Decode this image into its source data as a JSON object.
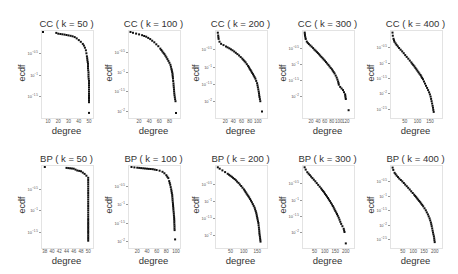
{
  "chart_data": [
    {
      "type": "scatter",
      "title": "CC ( k = 50 )",
      "xlabel": "degree",
      "ylabel": "ecdf",
      "xticks": [
        "10",
        "20",
        "30",
        "40",
        "50"
      ],
      "xlim": [
        5,
        51
      ],
      "yticks": [
        "10^-0.5",
        "10^-1",
        "10^-1.5"
      ],
      "ylim": [
        -1.95,
        0
      ],
      "yscale": "log10",
      "points": [
        [
          5,
          0
        ],
        [
          18,
          -0.02
        ],
        [
          20,
          -0.04
        ],
        [
          26,
          -0.06
        ],
        [
          30,
          -0.08
        ],
        [
          34,
          -0.1
        ],
        [
          36,
          -0.12
        ],
        [
          38,
          -0.15
        ],
        [
          40,
          -0.19
        ],
        [
          42,
          -0.23
        ],
        [
          44,
          -0.28
        ],
        [
          45,
          -0.32
        ],
        [
          46,
          -0.37
        ],
        [
          47,
          -0.43
        ],
        [
          47.5,
          -0.5
        ],
        [
          48,
          -0.57
        ],
        [
          48.5,
          -0.66
        ],
        [
          49,
          -0.75
        ],
        [
          49,
          -0.85
        ],
        [
          49.5,
          -0.95
        ],
        [
          49.5,
          -1.05
        ],
        [
          50,
          -1.15
        ],
        [
          50,
          -1.3
        ],
        [
          50,
          -1.45
        ],
        [
          50,
          -1.65
        ],
        [
          50,
          -1.9
        ]
      ]
    },
    {
      "type": "scatter",
      "title": "CC ( k = 100 )",
      "xlabel": "degree",
      "ylabel": "ecdf",
      "xticks": [
        "20",
        "40",
        "60",
        "80"
      ],
      "xlim": [
        2,
        95
      ],
      "yticks": [
        "10^-0.5",
        "10^-1",
        "10^-1.5",
        "10^-2"
      ],
      "ylim": [
        -2.1,
        0
      ],
      "yscale": "log10",
      "points": [
        [
          3,
          0
        ],
        [
          8,
          -0.02
        ],
        [
          14,
          -0.04
        ],
        [
          20,
          -0.06
        ],
        [
          26,
          -0.08
        ],
        [
          30,
          -0.1
        ],
        [
          34,
          -0.12
        ],
        [
          38,
          -0.15
        ],
        [
          42,
          -0.18
        ],
        [
          46,
          -0.22
        ],
        [
          50,
          -0.26
        ],
        [
          54,
          -0.31
        ],
        [
          58,
          -0.36
        ],
        [
          62,
          -0.42
        ],
        [
          66,
          -0.49
        ],
        [
          70,
          -0.56
        ],
        [
          74,
          -0.64
        ],
        [
          78,
          -0.73
        ],
        [
          82,
          -0.83
        ],
        [
          84,
          -0.93
        ],
        [
          86,
          -1.05
        ],
        [
          87,
          -1.18
        ],
        [
          88,
          -1.3
        ],
        [
          89,
          -1.45
        ],
        [
          90,
          -1.6
        ],
        [
          92,
          -1.75
        ],
        [
          93,
          -2.05
        ]
      ]
    },
    {
      "type": "scatter",
      "title": "CC ( k = 200 )",
      "xlabel": "degree",
      "ylabel": "ecdf",
      "xticks": [
        "20",
        "40",
        "60",
        "80",
        "100"
      ],
      "xlim": [
        0,
        115
      ],
      "yticks": [
        "10^-0.5",
        "10^-1",
        "10^-1.5",
        "10^-2"
      ],
      "ylim": [
        -2.4,
        0
      ],
      "yscale": "log10",
      "points": [
        [
          2,
          -0.02
        ],
        [
          3,
          -0.1
        ],
        [
          4,
          -0.2
        ],
        [
          6,
          -0.28
        ],
        [
          10,
          -0.34
        ],
        [
          16,
          -0.38
        ],
        [
          22,
          -0.42
        ],
        [
          30,
          -0.47
        ],
        [
          38,
          -0.53
        ],
        [
          46,
          -0.6
        ],
        [
          54,
          -0.68
        ],
        [
          62,
          -0.77
        ],
        [
          70,
          -0.88
        ],
        [
          76,
          -0.98
        ],
        [
          82,
          -1.1
        ],
        [
          88,
          -1.22
        ],
        [
          94,
          -1.35
        ],
        [
          98,
          -1.48
        ],
        [
          100,
          -1.6
        ],
        [
          102,
          -1.72
        ],
        [
          104,
          -1.88
        ],
        [
          106,
          -2.0
        ],
        [
          110,
          -2.3
        ]
      ]
    },
    {
      "type": "scatter",
      "title": "CC ( k = 300 )",
      "xlabel": "degree",
      "ylabel": "ecdf",
      "xticks": [
        "20",
        "40",
        "60",
        "80",
        "100",
        "120"
      ],
      "xlim": [
        0,
        135
      ],
      "yticks": [
        "10^-0.5",
        "10^-1",
        "10^-1.5",
        "10^-2"
      ],
      "ylim": [
        -2.6,
        0
      ],
      "yscale": "log10",
      "points": [
        [
          2,
          -0.02
        ],
        [
          3,
          -0.12
        ],
        [
          5,
          -0.22
        ],
        [
          8,
          -0.3
        ],
        [
          14,
          -0.38
        ],
        [
          22,
          -0.46
        ],
        [
          30,
          -0.55
        ],
        [
          40,
          -0.66
        ],
        [
          50,
          -0.78
        ],
        [
          60,
          -0.9
        ],
        [
          70,
          -1.03
        ],
        [
          80,
          -1.17
        ],
        [
          88,
          -1.3
        ],
        [
          94,
          -1.43
        ],
        [
          98,
          -1.55
        ],
        [
          100,
          -1.65
        ],
        [
          104,
          -1.72
        ],
        [
          112,
          -1.82
        ],
        [
          118,
          -1.95
        ],
        [
          120,
          -2.1
        ],
        [
          128,
          -2.45
        ]
      ]
    },
    {
      "type": "scatter",
      "title": "CC ( k = 400 )",
      "xlabel": "degree",
      "ylabel": "ecdf",
      "xticks": [
        "50",
        "100",
        "150"
      ],
      "xlim": [
        0,
        185
      ],
      "yticks": [
        "10^-0.5",
        "10^-1",
        "10^-1.5",
        "10^-2",
        "10^-2.5"
      ],
      "ylim": [
        -2.7,
        0
      ],
      "yscale": "log10",
      "points": [
        [
          2,
          -0.02
        ],
        [
          3,
          -0.12
        ],
        [
          6,
          -0.22
        ],
        [
          10,
          -0.32
        ],
        [
          18,
          -0.42
        ],
        [
          28,
          -0.52
        ],
        [
          40,
          -0.63
        ],
        [
          52,
          -0.75
        ],
        [
          64,
          -0.87
        ],
        [
          76,
          -0.99
        ],
        [
          88,
          -1.12
        ],
        [
          100,
          -1.26
        ],
        [
          112,
          -1.4
        ],
        [
          122,
          -1.54
        ],
        [
          130,
          -1.68
        ],
        [
          138,
          -1.82
        ],
        [
          146,
          -1.96
        ],
        [
          152,
          -2.1
        ],
        [
          156,
          -2.25
        ],
        [
          160,
          -2.4
        ],
        [
          164,
          -2.6
        ]
      ]
    },
    {
      "type": "scatter",
      "title": "BP ( k = 50 )",
      "xlabel": "degree",
      "ylabel": "ecdf",
      "xticks": [
        "38",
        "40",
        "42",
        "44",
        "46",
        "48",
        "50"
      ],
      "xlim": [
        37.5,
        50.5
      ],
      "yticks": [
        "10^-0.5",
        "10^-1",
        "10^-1.5"
      ],
      "ylim": [
        -1.8,
        0
      ],
      "yscale": "log10",
      "points": [
        [
          38,
          0
        ],
        [
          44,
          -0.02
        ],
        [
          46,
          -0.04
        ],
        [
          46.5,
          -0.06
        ],
        [
          47,
          -0.08
        ],
        [
          48,
          -0.1
        ],
        [
          48.5,
          -0.13
        ],
        [
          49,
          -0.16
        ],
        [
          49.5,
          -0.2
        ],
        [
          50,
          -0.25
        ],
        [
          50,
          -0.3
        ],
        [
          50,
          -0.4
        ],
        [
          50,
          -0.5
        ],
        [
          50,
          -0.6
        ],
        [
          50,
          -0.7
        ],
        [
          50,
          -0.8
        ],
        [
          50,
          -0.9
        ],
        [
          50,
          -1.0
        ],
        [
          50,
          -1.1
        ],
        [
          50,
          -1.2
        ],
        [
          50,
          -1.35
        ],
        [
          50,
          -1.5
        ],
        [
          50,
          -1.7
        ]
      ]
    },
    {
      "type": "scatter",
      "title": "BP ( k = 100 )",
      "xlabel": "degree",
      "ylabel": "ecdf",
      "xticks": [
        "20",
        "40",
        "60",
        "80",
        "100"
      ],
      "xlim": [
        5,
        102
      ],
      "yticks": [
        "10^-0.5",
        "10^-1",
        "10^-1.5",
        "10^-2"
      ],
      "ylim": [
        -2.1,
        0
      ],
      "yscale": "log10",
      "points": [
        [
          8,
          0
        ],
        [
          14,
          -0.01
        ],
        [
          20,
          -0.02
        ],
        [
          28,
          -0.03
        ],
        [
          36,
          -0.04
        ],
        [
          44,
          -0.05
        ],
        [
          52,
          -0.06
        ],
        [
          60,
          -0.08
        ],
        [
          66,
          -0.1
        ],
        [
          72,
          -0.13
        ],
        [
          76,
          -0.17
        ],
        [
          80,
          -0.22
        ],
        [
          84,
          -0.3
        ],
        [
          86,
          -0.38
        ],
        [
          88,
          -0.48
        ],
        [
          90,
          -0.6
        ],
        [
          92,
          -0.75
        ],
        [
          93,
          -0.9
        ],
        [
          94,
          -1.05
        ],
        [
          95,
          -1.2
        ],
        [
          96,
          -1.35
        ],
        [
          96.5,
          -1.5
        ],
        [
          97,
          -1.7
        ],
        [
          98,
          -1.95
        ]
      ]
    },
    {
      "type": "scatter",
      "title": "BP ( k = 200 )",
      "xlabel": "degree",
      "ylabel": "ecdf",
      "xticks": [
        "50",
        "100",
        "150"
      ],
      "xlim": [
        0,
        175
      ],
      "yticks": [
        "10^-0.5",
        "10^-1",
        "10^-1.5",
        "10^-2"
      ],
      "ylim": [
        -2.3,
        0
      ],
      "yscale": "log10",
      "points": [
        [
          3,
          -0.01
        ],
        [
          10,
          -0.05
        ],
        [
          20,
          -0.1
        ],
        [
          30,
          -0.15
        ],
        [
          40,
          -0.2
        ],
        [
          50,
          -0.26
        ],
        [
          60,
          -0.32
        ],
        [
          70,
          -0.39
        ],
        [
          80,
          -0.47
        ],
        [
          90,
          -0.56
        ],
        [
          100,
          -0.66
        ],
        [
          110,
          -0.78
        ],
        [
          120,
          -0.9
        ],
        [
          130,
          -1.04
        ],
        [
          140,
          -1.2
        ],
        [
          146,
          -1.35
        ],
        [
          150,
          -1.5
        ],
        [
          154,
          -1.65
        ],
        [
          156,
          -1.78
        ],
        [
          158,
          -1.95
        ],
        [
          162,
          -2.2
        ]
      ]
    },
    {
      "type": "scatter",
      "title": "BP ( k = 300 )",
      "xlabel": "degree",
      "ylabel": "ecdf",
      "xticks": [
        "50",
        "100",
        "150",
        "200"
      ],
      "xlim": [
        0,
        225
      ],
      "yticks": [
        "10^-0.5",
        "10^-1",
        "10^-1.5",
        "10^-2"
      ],
      "ylim": [
        -2.4,
        0
      ],
      "yscale": "log10",
      "points": [
        [
          3,
          -0.01
        ],
        [
          8,
          -0.08
        ],
        [
          16,
          -0.16
        ],
        [
          28,
          -0.25
        ],
        [
          40,
          -0.34
        ],
        [
          54,
          -0.44
        ],
        [
          68,
          -0.55
        ],
        [
          82,
          -0.66
        ],
        [
          96,
          -0.78
        ],
        [
          110,
          -0.91
        ],
        [
          124,
          -1.05
        ],
        [
          138,
          -1.2
        ],
        [
          150,
          -1.35
        ],
        [
          162,
          -1.5
        ],
        [
          170,
          -1.62
        ],
        [
          178,
          -1.75
        ],
        [
          184,
          -1.82
        ],
        [
          190,
          -1.9
        ],
        [
          194,
          -2.0
        ],
        [
          200,
          -2.35
        ]
      ]
    },
    {
      "type": "scatter",
      "title": "BP ( k = 400 )",
      "xlabel": "degree",
      "ylabel": "ecdf",
      "xticks": [
        "50",
        "100",
        "150",
        "200"
      ],
      "xlim": [
        0,
        220
      ],
      "yticks": [
        "10^-0.5",
        "10^-1",
        "10^-1.5",
        "10^-2",
        "10^-2.5"
      ],
      "ylim": [
        -2.7,
        0
      ],
      "yscale": "log10",
      "points": [
        [
          3,
          -0.02
        ],
        [
          6,
          -0.1
        ],
        [
          12,
          -0.2
        ],
        [
          22,
          -0.3
        ],
        [
          34,
          -0.4
        ],
        [
          48,
          -0.5
        ],
        [
          62,
          -0.61
        ],
        [
          76,
          -0.72
        ],
        [
          90,
          -0.84
        ],
        [
          104,
          -0.96
        ],
        [
          118,
          -1.09
        ],
        [
          132,
          -1.22
        ],
        [
          146,
          -1.36
        ],
        [
          158,
          -1.5
        ],
        [
          168,
          -1.64
        ],
        [
          176,
          -1.78
        ],
        [
          182,
          -1.92
        ],
        [
          186,
          -2.05
        ],
        [
          190,
          -2.2
        ],
        [
          196,
          -2.4
        ],
        [
          200,
          -2.6
        ]
      ]
    }
  ]
}
